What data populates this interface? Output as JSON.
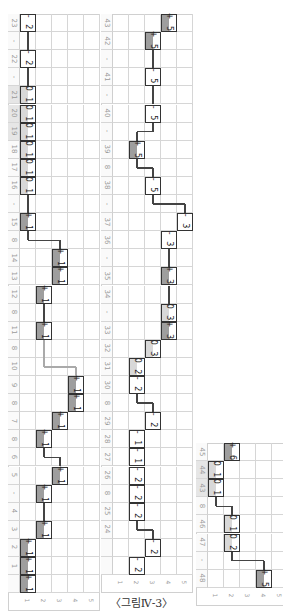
{
  "caption": "〈그림Ⅳ-3〉",
  "column_labels": [
    "1",
    "2",
    "3",
    "4",
    "5"
  ],
  "strips": [
    {
      "rows": [
        {
          "label": "23",
          "shade": false
        },
        {
          "label": "-",
          "shade": false
        },
        {
          "label": "22",
          "shade": false
        },
        {
          "label": "-",
          "shade": false
        },
        {
          "label": "21",
          "shade": true
        },
        {
          "label": "20",
          "shade": true
        },
        {
          "label": "19",
          "shade": true
        },
        {
          "label": "18",
          "shade": false
        },
        {
          "label": "17",
          "shade": false
        },
        {
          "label": "16",
          "shade": false
        },
        {
          "label": "-",
          "shade": false
        },
        {
          "label": "15",
          "shade": false
        },
        {
          "label": "8",
          "shade": false
        },
        {
          "label": "14",
          "shade": false
        },
        {
          "label": "13",
          "shade": false
        },
        {
          "label": "12",
          "shade": false
        },
        {
          "label": "8",
          "shade": false
        },
        {
          "label": "11",
          "shade": false
        },
        {
          "label": "8",
          "shade": false
        },
        {
          "label": "10",
          "shade": false
        },
        {
          "label": "9",
          "shade": false
        },
        {
          "label": "8",
          "shade": false
        },
        {
          "label": "7",
          "shade": false
        },
        {
          "label": "8",
          "shade": false
        },
        {
          "label": "6",
          "shade": false
        },
        {
          "label": "5",
          "shade": false
        },
        {
          "label": "-",
          "shade": false
        },
        {
          "label": "4",
          "shade": false
        },
        {
          "label": "3",
          "shade": false
        },
        {
          "label": "2",
          "shade": false
        },
        {
          "label": "1",
          "shade": false
        }
      ],
      "boxes": [
        {
          "row": 0,
          "col": 1,
          "text": "- 2",
          "fill": "none"
        },
        {
          "row": 2,
          "col": 1,
          "text": "- 2",
          "fill": "none"
        },
        {
          "row": 4,
          "col": 1,
          "text": "0 1",
          "fill": "light"
        },
        {
          "row": 5,
          "col": 1,
          "text": "0 1",
          "fill": "light"
        },
        {
          "row": 6,
          "col": 1,
          "text": "0 1",
          "fill": "light"
        },
        {
          "row": 7,
          "col": 1,
          "text": "0 1",
          "fill": "light"
        },
        {
          "row": 8,
          "col": 1,
          "text": "0 1",
          "fill": "light"
        },
        {
          "row": 9,
          "col": 1,
          "text": "0 1",
          "fill": "light"
        },
        {
          "row": 11,
          "col": 1,
          "text": "+ 1",
          "fill": "dark"
        },
        {
          "row": 13,
          "col": 3,
          "text": "+ 1",
          "fill": "dark"
        },
        {
          "row": 14,
          "col": 3,
          "text": "+ 1",
          "fill": "dark"
        },
        {
          "row": 15,
          "col": 2,
          "text": "+ 1",
          "fill": "dark"
        },
        {
          "row": 17,
          "col": 2,
          "text": "+ 1",
          "fill": "dark"
        },
        {
          "row": 20,
          "col": 4,
          "text": "+ 1",
          "fill": "dark"
        },
        {
          "row": 21,
          "col": 4,
          "text": "+ 1",
          "fill": "dark"
        },
        {
          "row": 22,
          "col": 3,
          "text": "+ 1",
          "fill": "dark"
        },
        {
          "row": 23,
          "col": 2,
          "text": "+ 1",
          "fill": "dark"
        },
        {
          "row": 25,
          "col": 3,
          "text": "+ 1",
          "fill": "dark"
        },
        {
          "row": 26,
          "col": 2,
          "text": "+ 1",
          "fill": "dark"
        },
        {
          "row": 28,
          "col": 2,
          "text": "+ 1",
          "fill": "dark"
        },
        {
          "row": 29,
          "col": 1,
          "text": "+ 1",
          "fill": "dark"
        },
        {
          "row": 30,
          "col": 1,
          "text": "+ 1",
          "fill": "dark"
        },
        {
          "row": 31,
          "col": 1,
          "text": "+ 1",
          "fill": "dark"
        }
      ]
    },
    {
      "rows": [
        {
          "label": "43",
          "shade": false
        },
        {
          "label": "42",
          "shade": false
        },
        {
          "label": "-",
          "shade": false
        },
        {
          "label": "41",
          "shade": false
        },
        {
          "label": "-",
          "shade": false
        },
        {
          "label": "40",
          "shade": false
        },
        {
          "label": "-",
          "shade": false
        },
        {
          "label": "39",
          "shade": false
        },
        {
          "label": "8",
          "shade": false
        },
        {
          "label": "38",
          "shade": false
        },
        {
          "label": "-",
          "shade": false
        },
        {
          "label": "37",
          "shade": false
        },
        {
          "label": "36",
          "shade": false
        },
        {
          "label": "-",
          "shade": false
        },
        {
          "label": "35",
          "shade": false
        },
        {
          "label": "34",
          "shade": false
        },
        {
          "label": "-",
          "shade": false
        },
        {
          "label": "33",
          "shade": false
        },
        {
          "label": "32",
          "shade": false
        },
        {
          "label": "31",
          "shade": false
        },
        {
          "label": "30",
          "shade": false
        },
        {
          "label": "8",
          "shade": false
        },
        {
          "label": "29",
          "shade": false
        },
        {
          "label": "28",
          "shade": false
        },
        {
          "label": "27",
          "shade": false
        },
        {
          "label": "26",
          "shade": false
        },
        {
          "label": "8",
          "shade": false
        },
        {
          "label": "25",
          "shade": false
        },
        {
          "label": "24",
          "shade": false
        }
      ],
      "boxes": [
        {
          "row": 0,
          "col": 4,
          "text": "+ 5",
          "fill": "dark"
        },
        {
          "row": 1,
          "col": 3,
          "text": "+ 5",
          "fill": "dark"
        },
        {
          "row": 3,
          "col": 3,
          "text": "- 5",
          "fill": "none"
        },
        {
          "row": 5,
          "col": 3,
          "text": "- 5",
          "fill": "none"
        },
        {
          "row": 7,
          "col": 2,
          "text": "+ 5",
          "fill": "dark"
        },
        {
          "row": 9,
          "col": 3,
          "text": "- 5",
          "fill": "none"
        },
        {
          "row": 11,
          "col": 5,
          "text": "- 3",
          "fill": "none"
        },
        {
          "row": 12,
          "col": 4,
          "text": "- 3",
          "fill": "none"
        },
        {
          "row": 14,
          "col": 4,
          "text": "+ 3",
          "fill": "dark"
        },
        {
          "row": 16,
          "col": 4,
          "text": "0 3",
          "fill": "light"
        },
        {
          "row": 17,
          "col": 4,
          "text": "+ 3",
          "fill": "dark"
        },
        {
          "row": 18,
          "col": 3,
          "text": "0 3",
          "fill": "light"
        },
        {
          "row": 19,
          "col": 2,
          "text": "0 2",
          "fill": "light"
        },
        {
          "row": 20,
          "col": 2,
          "text": "- 2",
          "fill": "none"
        },
        {
          "row": 22,
          "col": 3,
          "text": "- 2",
          "fill": "none"
        },
        {
          "row": 23,
          "col": 2,
          "text": "- 1",
          "fill": "none"
        },
        {
          "row": 24,
          "col": 2,
          "text": "- 1",
          "fill": "none"
        },
        {
          "row": 25,
          "col": 2,
          "text": "- 2",
          "fill": "none"
        },
        {
          "row": 26,
          "col": 2,
          "text": "- 2",
          "fill": "none"
        },
        {
          "row": 27,
          "col": 2,
          "text": "- 2",
          "fill": "none"
        },
        {
          "row": 29,
          "col": 3,
          "text": "- 2",
          "fill": "none"
        },
        {
          "row": 30,
          "col": 2,
          "text": "- 2",
          "fill": "none"
        }
      ]
    },
    {
      "rows": [
        {
          "label": "45",
          "shade": false
        },
        {
          "label": "44",
          "shade": true
        },
        {
          "label": "43",
          "shade": true
        },
        {
          "label": "8",
          "shade": false
        },
        {
          "label": "46",
          "shade": false
        },
        {
          "label": "47",
          "shade": false
        },
        {
          "label": "-",
          "shade": false
        },
        {
          "label": "48",
          "shade": false
        }
      ],
      "boxes": [
        {
          "row": 0,
          "col": 2,
          "text": "+ 6",
          "fill": "dark"
        },
        {
          "row": 1,
          "col": 1,
          "text": "0 1",
          "fill": "light"
        },
        {
          "row": 2,
          "col": 1,
          "text": "0 1",
          "fill": "light"
        },
        {
          "row": 4,
          "col": 2,
          "text": "0 1",
          "fill": "light"
        },
        {
          "row": 5,
          "col": 2,
          "text": "0 2",
          "fill": "light"
        },
        {
          "row": 7,
          "col": 4,
          "text": "+ 5",
          "fill": "dark"
        }
      ]
    }
  ]
}
